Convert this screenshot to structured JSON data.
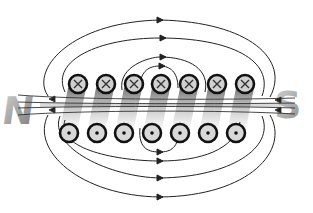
{
  "diagram": {
    "pole_north": "N",
    "pole_south": "S",
    "conductor_top_symbol": "×",
    "conductor_bottom_symbol": "•",
    "conductor_count_per_row": 7,
    "top_row_meaning": "current into page",
    "bottom_row_meaning": "current out of page",
    "field_line_direction": "right-to-left inside, left-to-right outside on top",
    "colors": {
      "line": "#222222",
      "conductor_fill": "#d0d0d0",
      "conductor_ring": "#111111",
      "shadow": "#555555",
      "label_gray": "#9a9a9a"
    }
  }
}
